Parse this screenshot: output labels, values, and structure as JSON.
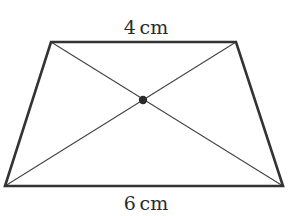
{
  "diagram": {
    "type": "trapezium-with-diagonals",
    "labels": {
      "top": "4 cm",
      "bottom": "6 cm"
    },
    "vertices": {
      "top_left": [
        51,
        42
      ],
      "top_right": [
        236,
        42
      ],
      "bottom_right": [
        283,
        186
      ],
      "bottom_left": [
        5,
        186
      ]
    },
    "intersection_point": [
      143,
      100
    ],
    "colors": {
      "outline": "#333333",
      "diagonal": "#444444",
      "dot": "#2a2a2a",
      "text": "#2a2a2a"
    }
  }
}
